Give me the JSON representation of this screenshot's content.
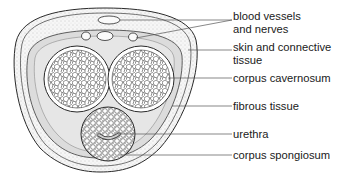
{
  "diagram": {
    "type": "anatomical cross-section",
    "colors": {
      "outline": "#2a2a2a",
      "skin_fill": "#f3f3f3",
      "fibrous_fill": "#dcdcdc",
      "tissue_fill": "#ffffff",
      "leader_line": "#555555"
    },
    "labels": [
      {
        "id": "blood-vessels",
        "line1": "blood vessels",
        "line2": "and nerves"
      },
      {
        "id": "skin",
        "line1": "skin and connective",
        "line2": "tissue"
      },
      {
        "id": "cavernosum",
        "line1": "corpus cavernosum"
      },
      {
        "id": "fibrous",
        "line1": "fibrous tissue"
      },
      {
        "id": "urethra",
        "line1": "urethra"
      },
      {
        "id": "spongiosum",
        "line1": "corpus spongiosum"
      }
    ]
  }
}
